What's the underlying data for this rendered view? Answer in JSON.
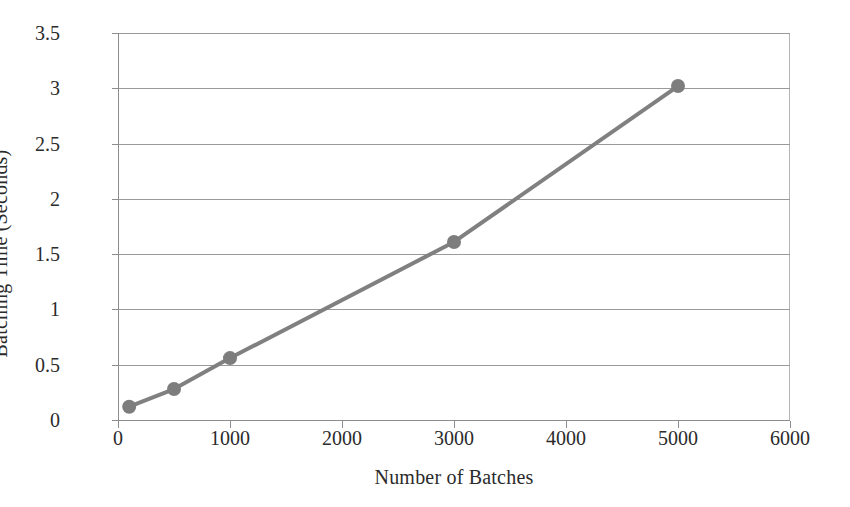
{
  "chart_data": {
    "type": "line",
    "title": "",
    "xlabel": "Number of Batches",
    "ylabel": "Batching Time (Seconds)",
    "xlim": [
      0,
      6000
    ],
    "ylim": [
      0,
      3.5
    ],
    "xticks": [
      0,
      1000,
      2000,
      3000,
      4000,
      5000,
      6000
    ],
    "xtick_labels": [
      "0",
      "1000",
      "2000",
      "3000",
      "4000",
      "5000",
      "6000"
    ],
    "yticks": [
      0,
      0.5,
      1,
      1.5,
      2,
      2.5,
      3,
      3.5
    ],
    "ytick_labels": [
      "0",
      "0.5",
      "1",
      "1.5",
      "2",
      "2.5",
      "3",
      "3.5"
    ],
    "grid": "horizontal",
    "legend": "none",
    "series": [
      {
        "name": "Batching Time",
        "color": "#808080",
        "marker": "circle",
        "x": [
          100,
          500,
          1000,
          3000,
          5000
        ],
        "values": [
          0.12,
          0.28,
          0.56,
          1.61,
          3.02
        ]
      }
    ]
  },
  "colors": {
    "line": "#808080",
    "marker": "#7d7d7d",
    "grid": "#9a9a9a",
    "axis": "#8d8d8d",
    "text": "#2b2b2b",
    "background": "#ffffff"
  }
}
